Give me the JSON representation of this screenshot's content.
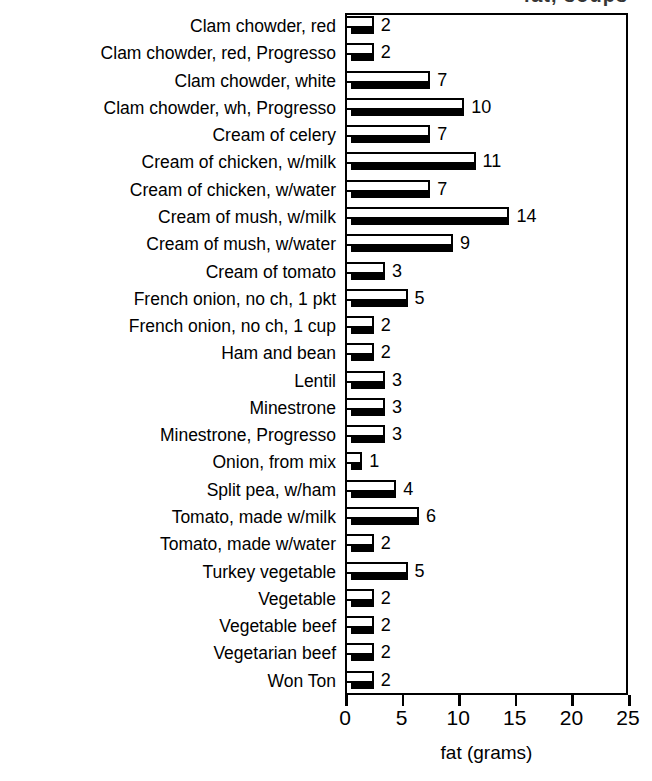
{
  "title_clipped": "fat, soups",
  "chart_data": {
    "type": "bar",
    "orientation": "horizontal",
    "title": "fat, soups",
    "xlabel": "fat (grams)",
    "ylabel": "",
    "xlim": [
      0,
      25
    ],
    "xticks": [
      0,
      5,
      10,
      15,
      20,
      25
    ],
    "grid": false,
    "legend": "none",
    "bar_style": "3d-white-face-black-shadow",
    "value_labels": true,
    "categories": [
      "Clam chowder, red",
      "Clam chowder, red, Progresso",
      "Clam chowder, white",
      "Clam chowder, wh, Progresso",
      "Cream of celery",
      "Cream of chicken, w/milk",
      "Cream of chicken, w/water",
      "Cream of mush, w/milk",
      "Cream of mush, w/water",
      "Cream of tomato",
      "French onion, no ch, 1 pkt",
      "French onion, no ch, 1 cup",
      "Ham and bean",
      "Lentil",
      "Minestrone",
      "Minestrone, Progresso",
      "Onion, from mix",
      "Split pea, w/ham",
      "Tomato, made w/milk",
      "Tomato, made w/water",
      "Turkey vegetable",
      "Vegetable",
      "Vegetable beef",
      "Vegetarian beef",
      "Won Ton"
    ],
    "values": [
      2,
      2,
      7,
      10,
      7,
      11,
      7,
      14,
      9,
      3,
      5,
      2,
      2,
      3,
      3,
      3,
      1,
      4,
      6,
      2,
      5,
      2,
      2,
      2,
      2
    ]
  },
  "colors": {
    "bar_face": "#ffffff",
    "bar_shadow": "#000000",
    "outline": "#000000",
    "background": "#ffffff",
    "text": "#000000"
  }
}
